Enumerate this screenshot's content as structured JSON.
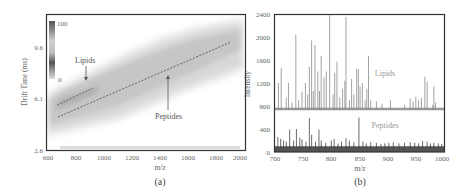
{
  "figure": {
    "panels": [
      "(a)",
      "(b)"
    ]
  },
  "chart_data": [
    {
      "type": "heatmap",
      "panel": "(a)",
      "title": "",
      "xlabel": "m/z",
      "ylabel": "Drift Time (ms)",
      "xlim": [
        600,
        2000
      ],
      "ylim": [
        2.6,
        13.1
      ],
      "xticks": [
        600,
        800,
        1000,
        1200,
        1400,
        1600,
        1800,
        2000
      ],
      "yticks": [
        2.6,
        6.1,
        9.6
      ],
      "colorbar": {
        "min_label": "0",
        "max_label": "100",
        "min": 0,
        "max": 100
      },
      "annotations": [
        {
          "text": "Lipids",
          "arrow_to": [
            880,
            7.1
          ]
        },
        {
          "text": "Peptides",
          "arrow_to": [
            1480,
            7.9
          ]
        }
      ],
      "trend_lines": [
        {
          "name": "Lipids",
          "style": "dashed",
          "points": [
            [
              660,
              5.7
            ],
            [
              920,
              7.3
            ]
          ]
        },
        {
          "name": "Peptides",
          "style": "dashed",
          "points": [
            [
              660,
              4.9
            ],
            [
              1900,
              12.0
            ]
          ]
        }
      ],
      "band": {
        "description": "Diffuse gray intensity band rising from lower-left to upper-right",
        "lower_edge": [
          [
            600,
            3.3
          ],
          [
            1200,
            5.6
          ],
          [
            2000,
            8.9
          ]
        ],
        "upper_edge": [
          [
            600,
            5.6
          ],
          [
            1200,
            9.6
          ],
          [
            2000,
            12.4
          ]
        ]
      }
    },
    {
      "type": "bar",
      "panel": "(b)",
      "title": "",
      "xlabel": "m/z",
      "ylabel": "Intensity",
      "xlim": [
        700,
        1000
      ],
      "ylim": [
        0,
        2400
      ],
      "xticks": [
        700,
        750,
        800,
        850,
        900,
        950,
        1000
      ],
      "yticks": [
        0,
        400,
        800,
        1200,
        1600,
        2000,
        2400
      ],
      "series": [
        {
          "name": "Lipids",
          "baseline": 740,
          "x": [
            706,
            711,
            720,
            724,
            730,
            737,
            742,
            748,
            754,
            758,
            761,
            765,
            768,
            771,
            776,
            779,
            782,
            787,
            791,
            797,
            803,
            806,
            810,
            815,
            820,
            824,
            826,
            832,
            836,
            840,
            845,
            848,
            851,
            855,
            860,
            863,
            866,
            870,
            880,
            890,
            905,
            930,
            940,
            945,
            950,
            955,
            960,
            966,
            970,
            980,
            982,
            985
          ],
          "values": [
            1200,
            1460,
            950,
            1200,
            860,
            2040,
            900,
            1050,
            1200,
            1000,
            1480,
            1940,
            1060,
            1860,
            1400,
            1060,
            1670,
            1300,
            1400,
            2380,
            1000,
            1380,
            1570,
            950,
            1100,
            1240,
            2350,
            900,
            1270,
            1000,
            1450,
            1440,
            1140,
            1200,
            900,
            1100,
            1670,
            900,
            880,
            840,
            900,
            820,
            930,
            880,
            960,
            900,
            940,
            1310,
            1220,
            820,
            1140,
            860
          ]
        },
        {
          "name": "Peptides",
          "baseline": 40,
          "x": [
            705,
            710,
            715,
            720,
            726,
            733,
            738,
            744,
            748,
            755,
            761,
            765,
            772,
            778,
            782,
            790,
            800,
            805,
            812,
            818,
            826,
            832,
            840,
            849,
            856,
            862,
            870,
            880,
            888,
            895,
            902,
            910,
            920,
            930,
            940,
            948,
            955,
            962,
            970,
            976,
            982,
            990,
            996
          ],
          "values": [
            260,
            230,
            200,
            180,
            390,
            200,
            400,
            250,
            220,
            180,
            590,
            300,
            180,
            390,
            200,
            160,
            200,
            230,
            150,
            180,
            240,
            200,
            170,
            600,
            180,
            150,
            170,
            160,
            140,
            150,
            160,
            170,
            150,
            160,
            170,
            160,
            150,
            190,
            180,
            150,
            160,
            150,
            140
          ]
        }
      ],
      "annotations": [
        {
          "text": "Lipids",
          "x": 920,
          "y": 1380
        },
        {
          "text": "Peptides",
          "x": 920,
          "y": 460
        }
      ]
    }
  ],
  "labels": {
    "a": {
      "xlabel": "m/z",
      "ylabel": "Drift Time (ms)",
      "xticks": [
        "600",
        "800",
        "1000",
        "1200",
        "1400",
        "1600",
        "1800",
        "2000"
      ],
      "yticks": [
        "9.6",
        "6.1",
        "2.6"
      ],
      "cbar_max": "100",
      "cbar_min": "0",
      "ann_lipids": "Lipids",
      "ann_peptides": "Peptides",
      "panel": "(a)"
    },
    "b": {
      "xlabel": "m/z",
      "ylabel": "Intensity",
      "xticks": [
        "700",
        "750",
        "800",
        "850",
        "900",
        "950",
        "1000"
      ],
      "yticks": [
        "2400",
        "2000",
        "1600",
        "1200",
        "800",
        "400",
        "0"
      ],
      "ann_lipids": "Lipids",
      "ann_peptides": "Peptides",
      "panel": "(b)"
    }
  }
}
